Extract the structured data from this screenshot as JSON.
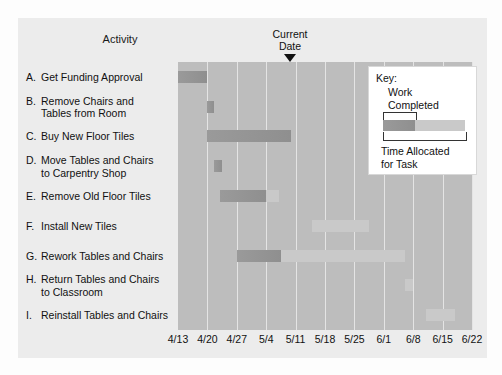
{
  "header": {
    "activity_column_title": "Activity",
    "current_date_line1": "Current",
    "current_date_line2": "Date",
    "current_date_value": "5/11"
  },
  "legend": {
    "title": "Key:",
    "work_completed_line1": "Work",
    "work_completed_line2": "Completed",
    "time_allocated_line1": "Time Allocated",
    "time_allocated_line2": "for Task",
    "completed_color": "#949494",
    "allocated_color": "#c9c9c9"
  },
  "chart_data": {
    "type": "bar",
    "title": "",
    "xlabel": "",
    "ylabel": "Activity",
    "grid": true,
    "legend_position": "inside-top-right",
    "x_tick_labels": [
      "4/13",
      "4/20",
      "4/27",
      "5/4",
      "5/11",
      "5/18",
      "5/25",
      "6/1",
      "6/8",
      "6/15",
      "6/22"
    ],
    "x_tick_values": [
      0,
      7,
      14,
      21,
      28,
      35,
      42,
      49,
      56,
      63,
      70
    ],
    "xlim": [
      0,
      70
    ],
    "current_date_x": 28,
    "categories": [
      "A. Get Funding Approval",
      "B. Remove Chairs and Tables from Room",
      "C. Buy New Floor Tiles",
      "D. Move Tables and Chairs to Carpentry Shop",
      "E. Remove Old Floor Tiles",
      "F. Install New Tiles",
      "G. Rework Tables and Chairs",
      "H. Return Tables and Chairs to Classroom",
      "I. Reinstall Tables and Chairs"
    ],
    "tasks": [
      {
        "letter": "A.",
        "label_line1": "Get Funding Approval",
        "label_line2": "",
        "start": 0,
        "end": 7,
        "completed_end": 7
      },
      {
        "letter": "B.",
        "label_line1": "Remove Chairs and",
        "label_line2": "Tables from Room",
        "start": 7,
        "end": 8.5,
        "completed_end": 8.5
      },
      {
        "letter": "C.",
        "label_line1": "Buy New Floor Tiles",
        "label_line2": "",
        "start": 7,
        "end": 27,
        "completed_end": 27
      },
      {
        "letter": "D.",
        "label_line1": "Move Tables and Chairs",
        "label_line2": "to Carpentry Shop",
        "start": 8.5,
        "end": 10.5,
        "completed_end": 10.5
      },
      {
        "letter": "E.",
        "label_line1": "Remove Old Floor Tiles",
        "label_line2": "",
        "start": 10,
        "end": 24,
        "completed_end": 21
      },
      {
        "letter": "F.",
        "label_line1": "Install New Tiles",
        "label_line2": "",
        "start": 32,
        "end": 45.5,
        "completed_end": 32
      },
      {
        "letter": "G.",
        "label_line1": "Rework Tables and Chairs",
        "label_line2": "",
        "start": 14,
        "end": 54,
        "completed_end": 24.5
      },
      {
        "letter": "H.",
        "label_line1": "Return Tables and Chairs",
        "label_line2": "to Classroom",
        "start": 54,
        "end": 56,
        "completed_end": 54
      },
      {
        "letter": "I.",
        "label_line1": "Reinstall Tables and Chairs",
        "label_line2": "",
        "start": 59,
        "end": 66,
        "completed_end": 59
      }
    ]
  }
}
